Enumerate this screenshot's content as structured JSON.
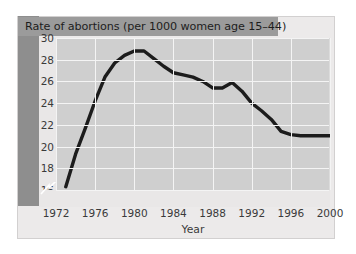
{
  "chart_data": {
    "type": "line",
    "title": "Rate of abortions (per 1000 women age 15–44)",
    "xlabel": "Year",
    "ylabel": "",
    "xlim": [
      1972,
      2000
    ],
    "ylim": [
      16,
      30
    ],
    "yticks": [
      16,
      18,
      20,
      22,
      24,
      26,
      28,
      30
    ],
    "ytick_labels": [
      "16",
      "18",
      "20",
      "22",
      "24",
      "26",
      "28",
      "30"
    ],
    "zero_tick_label": "0",
    "axis_break": true,
    "xticks": [
      1972,
      1976,
      1980,
      1984,
      1988,
      1992,
      1996,
      2000
    ],
    "xtick_labels": [
      "1972",
      "1976",
      "1980",
      "1984",
      "1988",
      "1992",
      "1996",
      "2000"
    ],
    "grid": true,
    "legend": null,
    "line_color": "#1c1c1c",
    "plot_background": "#cfcfcf",
    "gridline_color": "#f4f4f4",
    "series": [
      {
        "name": "Rate of abortions",
        "x": [
          1973,
          1974,
          1975,
          1976,
          1977,
          1978,
          1979,
          1980,
          1981,
          1982,
          1983,
          1984,
          1985,
          1986,
          1987,
          1988,
          1989,
          1990,
          1991,
          1992,
          1993,
          1994,
          1995,
          1996,
          1997,
          1998,
          1999,
          2000
        ],
        "values": [
          16.3,
          19.3,
          21.7,
          24.2,
          26.4,
          27.7,
          28.4,
          28.8,
          28.8,
          28.1,
          27.4,
          26.8,
          26.6,
          26.4,
          26.0,
          25.4,
          25.4,
          25.9,
          25.1,
          24.0,
          23.3,
          22.5,
          21.4,
          21.1,
          21.0,
          21.0,
          21.0,
          21.0
        ]
      }
    ]
  },
  "panel": {
    "title_band_color": "#9b9b9b",
    "left_band_color": "#8e8e8e",
    "panel_color": "#eceaea"
  }
}
